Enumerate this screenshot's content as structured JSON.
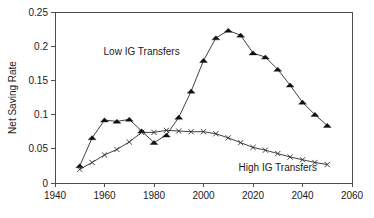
{
  "chart_data": {
    "type": "line",
    "title": "",
    "subtitle": "",
    "xlabel": "",
    "ylabel": "Net Saving Rate",
    "xlim": [
      1940,
      2060
    ],
    "ylim": [
      0,
      0.25
    ],
    "xticks": [
      1940,
      1960,
      1980,
      2000,
      2020,
      2040,
      2060
    ],
    "xtick_labels": [
      "1940",
      "1960",
      "1980",
      "2000",
      "2020",
      "2040",
      "2060"
    ],
    "yticks": [
      0,
      0.05,
      0.1,
      0.15,
      0.2,
      0.25
    ],
    "ytick_labels": [
      "0",
      "0.05",
      "0.1",
      "0.15",
      "0.2",
      "0.25"
    ],
    "grid": false,
    "legend_position": "inline-annotation",
    "x": [
      1950,
      1955,
      1960,
      1965,
      1970,
      1975,
      1980,
      1985,
      1990,
      1995,
      2000,
      2005,
      2010,
      2015,
      2020,
      2025,
      2030,
      2035,
      2040,
      2045,
      2050
    ],
    "series": [
      {
        "name": "Low IG Transfers",
        "marker": "triangle",
        "annotation_x": 1975,
        "annotation_y": 0.187,
        "values": [
          0.025,
          0.066,
          0.092,
          0.09,
          0.093,
          0.076,
          0.059,
          0.07,
          0.096,
          0.134,
          0.179,
          0.212,
          0.223,
          0.216,
          0.19,
          0.184,
          0.166,
          0.143,
          0.118,
          0.1,
          0.084
        ]
      },
      {
        "name": "High IG Transfers",
        "marker": "x",
        "annotation_x": 2030,
        "annotation_y": 0.018,
        "values": [
          0.02,
          0.03,
          0.041,
          0.049,
          0.06,
          0.074,
          0.074,
          0.077,
          0.076,
          0.075,
          0.075,
          0.072,
          0.066,
          0.059,
          0.052,
          0.048,
          0.043,
          0.038,
          0.034,
          0.03,
          0.027
        ]
      }
    ],
    "colors": {
      "axis": "#4d4d4d",
      "series_low": "#2b2b2b",
      "series_high": "#2b2b2b",
      "text": "#1a1a1a",
      "background": "#ffffff"
    }
  },
  "caption": {
    "text": ""
  }
}
